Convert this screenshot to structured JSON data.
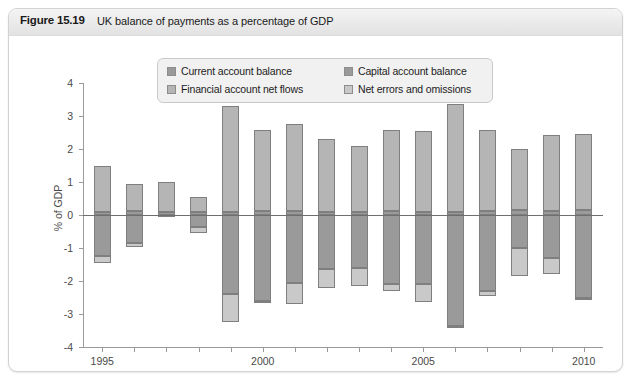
{
  "figure": {
    "number_label": "Figure 15.19",
    "title": "UK balance of payments as a percentage of GDP"
  },
  "legend": {
    "items": [
      {
        "label": "Current account balance",
        "color": "#9a9a9a"
      },
      {
        "label": "Capital account balance",
        "color": "#9a9a9a"
      },
      {
        "label": "Financial account net flows",
        "color": "#b5b5b5"
      },
      {
        "label": "Net errors and omissions",
        "color": "#c9c9c9"
      }
    ]
  },
  "chart_data": {
    "type": "bar",
    "stacked": true,
    "title": "UK balance of payments as a percentage of GDP",
    "xlabel": "",
    "ylabel": "% of GDP",
    "ylim": [
      -4,
      4
    ],
    "yticks": [
      4,
      3,
      2,
      1,
      0,
      -1,
      -2,
      -3,
      -4
    ],
    "ytick_labels": [
      "4",
      "3",
      "2",
      "1",
      "0",
      "-1",
      "-2",
      "-3",
      "-4"
    ],
    "xlim": [
      1994.4,
      2010.6
    ],
    "xticks": [
      1995,
      1996,
      1997,
      1998,
      1999,
      2000,
      2001,
      2002,
      2003,
      2004,
      2005,
      2006,
      2007,
      2008,
      2009,
      2010
    ],
    "xtick_labels_shown": [
      "1995",
      "2000",
      "2005",
      "2010"
    ],
    "grid": false,
    "legend_position": "upper-center",
    "categories": [
      1995,
      1996,
      1997,
      1998,
      1999,
      2000,
      2001,
      2002,
      2003,
      2004,
      2005,
      2006,
      2007,
      2008,
      2009,
      2010
    ],
    "series": [
      {
        "name": "Current account balance",
        "color": "#9a9a9a",
        "values": [
          -1.25,
          -0.85,
          -0.05,
          -0.35,
          -2.4,
          -2.6,
          -2.05,
          -1.65,
          -1.6,
          -2.1,
          -2.1,
          -3.35,
          -2.3,
          -1.0,
          -1.3,
          -2.5
        ]
      },
      {
        "name": "Capital account balance",
        "color": "#9a9a9a",
        "values": [
          0.1,
          0.12,
          0.1,
          0.1,
          0.1,
          0.12,
          0.12,
          0.1,
          0.1,
          0.12,
          0.1,
          0.1,
          0.12,
          0.15,
          0.12,
          0.15
        ]
      },
      {
        "name": "Financial account net flows",
        "color": "#b5b5b5",
        "values": [
          1.4,
          0.82,
          0.9,
          0.45,
          3.2,
          2.45,
          2.65,
          2.2,
          2.0,
          2.45,
          2.45,
          3.25,
          2.45,
          1.85,
          2.3,
          2.3
        ]
      },
      {
        "name": "Net errors and omissions",
        "color": "#c9c9c9",
        "values": [
          -0.2,
          -0.12,
          0.0,
          -0.2,
          -0.85,
          -0.05,
          -0.65,
          -0.55,
          -0.55,
          -0.2,
          -0.55,
          -0.05,
          -0.15,
          -0.85,
          -0.5,
          -0.05
        ]
      }
    ]
  }
}
